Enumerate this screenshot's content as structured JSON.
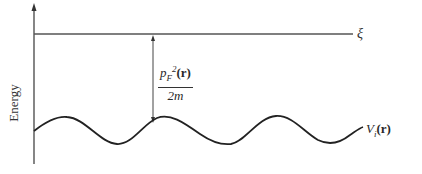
{
  "axis": {
    "ylabel": "Energy"
  },
  "labels": {
    "fermi_level": "ξ",
    "kinetic_num_p": "p",
    "kinetic_num_sub": "F",
    "kinetic_num_sup": "2",
    "kinetic_num_arg": "(r)",
    "kinetic_den": "2m",
    "potential_V": "V",
    "potential_sub": "i",
    "potential_arg": "(r)"
  },
  "colors": {
    "line": "#333333",
    "background": "#ffffff"
  }
}
